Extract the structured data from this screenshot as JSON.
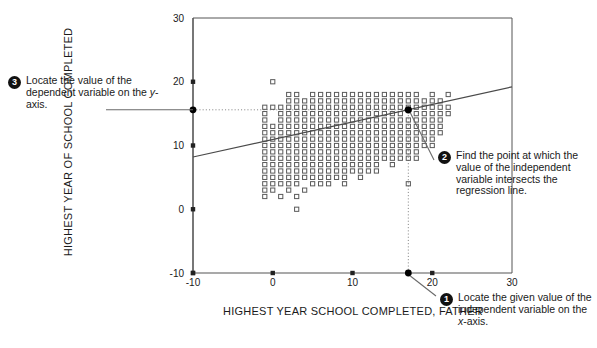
{
  "figure": {
    "x_axis_title": "HIGHEST YEAR SCHOOL COMPLETED, FATHER",
    "y_axis_title": "HIGHEST YEAR OF SCHOOL COMPLETED",
    "bottom_caption": ""
  },
  "callouts": [
    {
      "number": "1",
      "text": "Locate the given value of the independent variable on the ",
      "emphasis": "x",
      "tail": "-axis."
    },
    {
      "number": "2",
      "text": "Find the point at which the value of the independent variable intersects the regression line.",
      "emphasis": "",
      "tail": ""
    },
    {
      "number": "3",
      "text": "Locate the value of the dependent variable on the ",
      "emphasis": "y",
      "tail": "-axis."
    }
  ],
  "colors": {
    "axis": "#555555",
    "marker_stroke": "#5a5a5a",
    "regression_line": "#4a4a4a",
    "guide_line": "#8a8a8a",
    "highlight_point": "#000000",
    "callout_badge": "#111111",
    "text": "#1a1a1a"
  },
  "chart_data": {
    "type": "scatter",
    "title": "",
    "xlabel": "HIGHEST YEAR SCHOOL COMPLETED, FATHER",
    "ylabel": "HIGHEST YEAR OF SCHOOL COMPLETED",
    "xlim": [
      -10,
      30
    ],
    "ylim": [
      -10,
      30
    ],
    "xticks": [
      -10,
      0,
      10,
      20,
      30
    ],
    "yticks": [
      -10,
      0,
      10,
      20,
      30
    ],
    "grid": false,
    "legend": null,
    "marker": "open-square",
    "regression_line": {
      "x": [
        -10,
        30
      ],
      "y": [
        8.2,
        19.2
      ],
      "slope": 0.275,
      "intercept": 10.95
    },
    "highlight_point": {
      "x": 17,
      "y": 15.6,
      "label": ""
    },
    "guides": [
      {
        "type": "vertical",
        "x": 17,
        "from_y": -10,
        "to_y": 15.6
      },
      {
        "type": "horizontal",
        "y": 15.6,
        "from_x": -10,
        "to_x": 17
      }
    ],
    "axis_markers": [
      {
        "axis": "x",
        "value": 17,
        "style": "filled-dot"
      },
      {
        "axis": "y",
        "value": 15.6,
        "style": "filled-dot"
      }
    ],
    "points": [
      [
        0,
        20
      ],
      [
        2,
        18
      ],
      [
        3,
        18
      ],
      [
        5,
        18
      ],
      [
        6,
        18
      ],
      [
        7,
        18
      ],
      [
        8,
        18
      ],
      [
        9,
        18
      ],
      [
        10,
        18
      ],
      [
        11,
        18
      ],
      [
        12,
        18
      ],
      [
        13,
        18
      ],
      [
        14,
        18
      ],
      [
        15,
        18
      ],
      [
        16,
        18
      ],
      [
        17,
        18
      ],
      [
        18,
        18
      ],
      [
        20,
        18
      ],
      [
        22,
        18
      ],
      [
        2,
        17
      ],
      [
        3,
        17
      ],
      [
        4,
        17
      ],
      [
        5,
        17
      ],
      [
        6,
        17
      ],
      [
        7,
        17
      ],
      [
        8,
        17
      ],
      [
        9,
        17
      ],
      [
        10,
        17
      ],
      [
        11,
        17
      ],
      [
        12,
        17
      ],
      [
        13,
        17
      ],
      [
        14,
        17
      ],
      [
        15,
        17
      ],
      [
        16,
        17
      ],
      [
        17,
        17
      ],
      [
        18,
        17
      ],
      [
        19,
        17
      ],
      [
        20,
        17
      ],
      [
        21,
        17
      ],
      [
        -1,
        16
      ],
      [
        0,
        16
      ],
      [
        1,
        16
      ],
      [
        2,
        16
      ],
      [
        3,
        16
      ],
      [
        4,
        16
      ],
      [
        5,
        16
      ],
      [
        6,
        16
      ],
      [
        7,
        16
      ],
      [
        8,
        16
      ],
      [
        9,
        16
      ],
      [
        10,
        16
      ],
      [
        11,
        16
      ],
      [
        12,
        16
      ],
      [
        13,
        16
      ],
      [
        14,
        16
      ],
      [
        15,
        16
      ],
      [
        16,
        16
      ],
      [
        17,
        16
      ],
      [
        18,
        16
      ],
      [
        19,
        16
      ],
      [
        20,
        16
      ],
      [
        21,
        16
      ],
      [
        22,
        16
      ],
      [
        -1,
        15
      ],
      [
        1,
        15
      ],
      [
        2,
        15
      ],
      [
        3,
        15
      ],
      [
        4,
        15
      ],
      [
        5,
        15
      ],
      [
        6,
        15
      ],
      [
        7,
        15
      ],
      [
        8,
        15
      ],
      [
        9,
        15
      ],
      [
        10,
        15
      ],
      [
        11,
        15
      ],
      [
        12,
        15
      ],
      [
        13,
        15
      ],
      [
        14,
        15
      ],
      [
        15,
        15
      ],
      [
        16,
        15
      ],
      [
        18,
        15
      ],
      [
        19,
        15
      ],
      [
        20,
        15
      ],
      [
        21,
        15
      ],
      [
        22,
        15
      ],
      [
        -1,
        14
      ],
      [
        1,
        14
      ],
      [
        2,
        14
      ],
      [
        3,
        14
      ],
      [
        4,
        14
      ],
      [
        5,
        14
      ],
      [
        6,
        14
      ],
      [
        7,
        14
      ],
      [
        8,
        14
      ],
      [
        9,
        14
      ],
      [
        10,
        14
      ],
      [
        11,
        14
      ],
      [
        12,
        14
      ],
      [
        13,
        14
      ],
      [
        14,
        14
      ],
      [
        15,
        14
      ],
      [
        16,
        14
      ],
      [
        17,
        14
      ],
      [
        18,
        14
      ],
      [
        19,
        14
      ],
      [
        20,
        14
      ],
      [
        21,
        14
      ],
      [
        -1,
        13
      ],
      [
        0,
        13
      ],
      [
        1,
        13
      ],
      [
        2,
        13
      ],
      [
        3,
        13
      ],
      [
        4,
        13
      ],
      [
        5,
        13
      ],
      [
        6,
        13
      ],
      [
        7,
        13
      ],
      [
        8,
        13
      ],
      [
        9,
        13
      ],
      [
        10,
        13
      ],
      [
        11,
        13
      ],
      [
        12,
        13
      ],
      [
        13,
        13
      ],
      [
        14,
        13
      ],
      [
        15,
        13
      ],
      [
        16,
        13
      ],
      [
        17,
        13
      ],
      [
        18,
        13
      ],
      [
        19,
        13
      ],
      [
        20,
        13
      ],
      [
        21,
        13
      ],
      [
        -1,
        12
      ],
      [
        0,
        12
      ],
      [
        1,
        12
      ],
      [
        2,
        12
      ],
      [
        3,
        12
      ],
      [
        4,
        12
      ],
      [
        5,
        12
      ],
      [
        6,
        12
      ],
      [
        7,
        12
      ],
      [
        8,
        12
      ],
      [
        9,
        12
      ],
      [
        10,
        12
      ],
      [
        11,
        12
      ],
      [
        12,
        12
      ],
      [
        13,
        12
      ],
      [
        14,
        12
      ],
      [
        15,
        12
      ],
      [
        16,
        12
      ],
      [
        17,
        12
      ],
      [
        18,
        12
      ],
      [
        19,
        12
      ],
      [
        20,
        12
      ],
      [
        21,
        12
      ],
      [
        -1,
        11
      ],
      [
        0,
        11
      ],
      [
        1,
        11
      ],
      [
        2,
        11
      ],
      [
        3,
        11
      ],
      [
        4,
        11
      ],
      [
        5,
        11
      ],
      [
        6,
        11
      ],
      [
        7,
        11
      ],
      [
        8,
        11
      ],
      [
        9,
        11
      ],
      [
        10,
        11
      ],
      [
        11,
        11
      ],
      [
        12,
        11
      ],
      [
        13,
        11
      ],
      [
        14,
        11
      ],
      [
        15,
        11
      ],
      [
        16,
        11
      ],
      [
        17,
        11
      ],
      [
        18,
        11
      ],
      [
        19,
        11
      ],
      [
        20,
        11
      ],
      [
        -1,
        10
      ],
      [
        0,
        10
      ],
      [
        1,
        10
      ],
      [
        2,
        10
      ],
      [
        3,
        10
      ],
      [
        4,
        10
      ],
      [
        5,
        10
      ],
      [
        6,
        10
      ],
      [
        7,
        10
      ],
      [
        8,
        10
      ],
      [
        9,
        10
      ],
      [
        10,
        10
      ],
      [
        11,
        10
      ],
      [
        12,
        10
      ],
      [
        13,
        10
      ],
      [
        14,
        10
      ],
      [
        15,
        10
      ],
      [
        16,
        10
      ],
      [
        17,
        10
      ],
      [
        18,
        10
      ],
      [
        19,
        10
      ],
      [
        20,
        10
      ],
      [
        -1,
        9
      ],
      [
        0,
        9
      ],
      [
        1,
        9
      ],
      [
        2,
        9
      ],
      [
        3,
        9
      ],
      [
        4,
        9
      ],
      [
        5,
        9
      ],
      [
        6,
        9
      ],
      [
        7,
        9
      ],
      [
        8,
        9
      ],
      [
        9,
        9
      ],
      [
        10,
        9
      ],
      [
        11,
        9
      ],
      [
        12,
        9
      ],
      [
        13,
        9
      ],
      [
        14,
        9
      ],
      [
        15,
        9
      ],
      [
        16,
        9
      ],
      [
        17,
        9
      ],
      [
        18,
        9
      ],
      [
        -1,
        8
      ],
      [
        0,
        8
      ],
      [
        1,
        8
      ],
      [
        2,
        8
      ],
      [
        3,
        8
      ],
      [
        4,
        8
      ],
      [
        5,
        8
      ],
      [
        6,
        8
      ],
      [
        7,
        8
      ],
      [
        8,
        8
      ],
      [
        9,
        8
      ],
      [
        10,
        8
      ],
      [
        11,
        8
      ],
      [
        12,
        8
      ],
      [
        13,
        8
      ],
      [
        14,
        8
      ],
      [
        15,
        8
      ],
      [
        16,
        8
      ],
      [
        17,
        8
      ],
      [
        18,
        8
      ],
      [
        -1,
        7
      ],
      [
        0,
        7
      ],
      [
        1,
        7
      ],
      [
        2,
        7
      ],
      [
        3,
        7
      ],
      [
        4,
        7
      ],
      [
        5,
        7
      ],
      [
        6,
        7
      ],
      [
        7,
        7
      ],
      [
        8,
        7
      ],
      [
        9,
        7
      ],
      [
        10,
        7
      ],
      [
        11,
        7
      ],
      [
        12,
        7
      ],
      [
        13,
        7
      ],
      [
        15,
        7
      ],
      [
        -1,
        6
      ],
      [
        0,
        6
      ],
      [
        1,
        6
      ],
      [
        2,
        6
      ],
      [
        3,
        6
      ],
      [
        4,
        6
      ],
      [
        5,
        6
      ],
      [
        6,
        6
      ],
      [
        7,
        6
      ],
      [
        8,
        6
      ],
      [
        9,
        6
      ],
      [
        10,
        6
      ],
      [
        11,
        6
      ],
      [
        12,
        6
      ],
      [
        13,
        6
      ],
      [
        -1,
        5
      ],
      [
        0,
        5
      ],
      [
        1,
        5
      ],
      [
        2,
        5
      ],
      [
        3,
        5
      ],
      [
        4,
        5
      ],
      [
        5,
        5
      ],
      [
        6,
        5
      ],
      [
        7,
        5
      ],
      [
        8,
        5
      ],
      [
        9,
        5
      ],
      [
        11,
        5
      ],
      [
        -1,
        4
      ],
      [
        0,
        4
      ],
      [
        1,
        4
      ],
      [
        2,
        4
      ],
      [
        3,
        4
      ],
      [
        5,
        4
      ],
      [
        6,
        4
      ],
      [
        7,
        4
      ],
      [
        9,
        4
      ],
      [
        17,
        4
      ],
      [
        -1,
        3
      ],
      [
        0,
        3
      ],
      [
        2,
        3
      ],
      [
        4,
        3
      ],
      [
        -1,
        2
      ],
      [
        1,
        2
      ],
      [
        3,
        2
      ],
      [
        3,
        0
      ]
    ]
  }
}
